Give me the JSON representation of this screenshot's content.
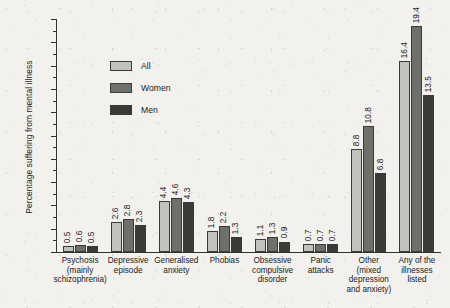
{
  "chart_data": {
    "type": "bar",
    "title": "",
    "xlabel": "",
    "ylabel": "Percentage suffering from mental illness",
    "ylim": [
      0,
      20
    ],
    "ytick_step": 2,
    "yticks": [
      0,
      2,
      4,
      6,
      8,
      10,
      12,
      14,
      16,
      18,
      20
    ],
    "minor_ticks": true,
    "grid": false,
    "legend_position": "upper-left-inside",
    "categories": [
      "Psychosis (mainly schizophrenia)",
      "Depressive episode",
      "Generalised anxiety",
      "Phobias",
      "Obsessive compulsive disorder",
      "Panic attacks",
      "Other (mixed depression and anxiety)",
      "Any of the illnesses listed"
    ],
    "category_lines": [
      [
        "Psychosis",
        "(mainly",
        "schizophrenia)"
      ],
      [
        "Depressive",
        "episode"
      ],
      [
        "Generalised",
        "anxiety"
      ],
      [
        "Phobias"
      ],
      [
        "Obsessive",
        "compulsive",
        "disorder"
      ],
      [
        "Panic",
        "attacks"
      ],
      [
        "Other",
        "(mixed",
        "depression",
        "and anxiety)"
      ],
      [
        "Any of the",
        "illnesses",
        "listed"
      ]
    ],
    "series": [
      {
        "name": "All",
        "color": "#c2c2bd",
        "values": [
          0.5,
          2.6,
          4.4,
          1.8,
          1.1,
          0.7,
          8.8,
          16.4
        ]
      },
      {
        "name": "Women",
        "color": "#6f6f6c",
        "values": [
          0.6,
          2.8,
          4.6,
          2.2,
          1.3,
          0.7,
          10.8,
          19.4
        ]
      },
      {
        "name": "Men",
        "color": "#3a3a38",
        "values": [
          0.5,
          2.3,
          4.3,
          1.3,
          0.9,
          0.7,
          6.8,
          13.5
        ]
      }
    ],
    "value_labels": [
      [
        "0.5",
        "0.6",
        "0.5"
      ],
      [
        "2.6",
        "2.8",
        "2.3"
      ],
      [
        "4.4",
        "4.6",
        "4.3"
      ],
      [
        "1.8",
        "2.2",
        "1.3"
      ],
      [
        "1.1",
        "1.3",
        "0.9"
      ],
      [
        "0.7",
        "0.7",
        "0.7"
      ],
      [
        "8.8",
        "10.8",
        "6.8"
      ],
      [
        "16.4",
        "19.4",
        "13.5"
      ]
    ]
  },
  "legend": {
    "items": [
      {
        "label": "All"
      },
      {
        "label": "Women"
      },
      {
        "label": "Men"
      }
    ]
  },
  "axis": {
    "y_title": "Percentage suffering from mental illness",
    "tick_labels": [
      "20",
      "18",
      "16",
      "14",
      "12",
      "10",
      "8",
      "6",
      "4",
      "2",
      "0"
    ]
  },
  "colors": {
    "all": "#c2c2bd",
    "women": "#6f6f6c",
    "men": "#3a3a38",
    "axis": "#35332f",
    "background": "#f2f1ee"
  }
}
